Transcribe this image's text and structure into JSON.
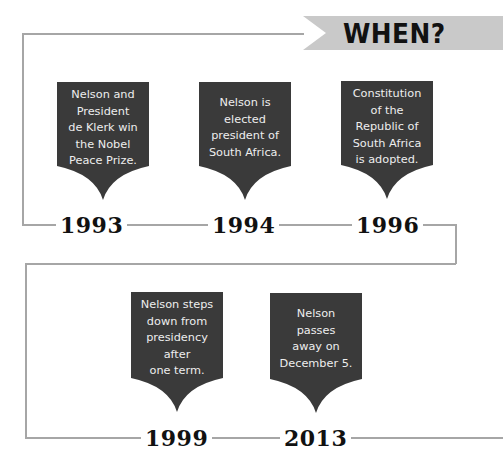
{
  "header": {
    "title": "WHEN?",
    "banner_color": "#c9c9c9"
  },
  "colors": {
    "card": "#3a3a3a",
    "card_text": "#eeeeee",
    "line": "#a6a6a6",
    "year": "#111111"
  },
  "timeline": {
    "rows": [
      {
        "events": [
          {
            "year": "1993",
            "text": "Nelson and\nPresident\nde Klerk win\nthe Nobel\nPeace Prize."
          },
          {
            "year": "1994",
            "text": "Nelson is\nelected\npresident of\nSouth Africa."
          },
          {
            "year": "1996",
            "text": "Constitution\nof the\nRepublic of\nSouth Africa\nis adopted."
          }
        ]
      },
      {
        "events": [
          {
            "year": "1999",
            "text": "Nelson steps\ndown from\npresidency\nafter\none term."
          },
          {
            "year": "2013",
            "text": "Nelson\npasses\naway on\nDecember 5."
          }
        ]
      }
    ]
  }
}
